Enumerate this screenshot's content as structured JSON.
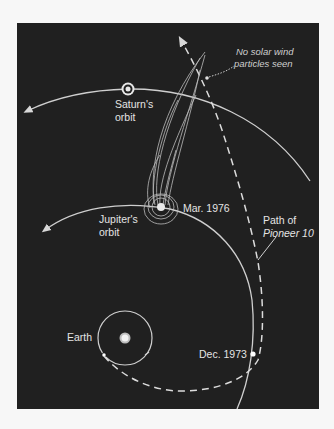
{
  "diagram": {
    "colors": {
      "background": "#202020",
      "page": "#f7f7f7",
      "lines": "#d8d8d8",
      "text": "#e4e4e4"
    },
    "labels": {
      "saturn_orbit_line1": "Saturn's",
      "saturn_orbit_line2": "orbit",
      "jupiter_orbit_line1": "Jupiter's",
      "jupiter_orbit_line2": "orbit",
      "earth": "Earth",
      "mar_1976": "Mar. 1976",
      "dec_1973": "Dec. 1973",
      "path_line1": "Path of",
      "path_line2": "Pioneer 10",
      "note_line1": "No solar wind",
      "note_line2": "particles seen"
    },
    "icons": {
      "sun": "sun-icon",
      "saturn": "saturn-icon",
      "jupiter": "jupiter-icon",
      "earth": "earth-dot-icon"
    }
  }
}
